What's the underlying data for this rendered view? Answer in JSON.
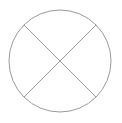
{
  "diagram": {
    "symbol": "circle-with-cross",
    "stroke_color": "#9a9a9a",
    "background_color": "#ffffff",
    "circle": {
      "cx": 60,
      "cy": 61,
      "r": 51
    },
    "lines": [
      {
        "x1": 24,
        "y1": 25,
        "x2": 96,
        "y2": 97
      },
      {
        "x1": 96,
        "y1": 25,
        "x2": 24,
        "y2": 97
      }
    ]
  }
}
